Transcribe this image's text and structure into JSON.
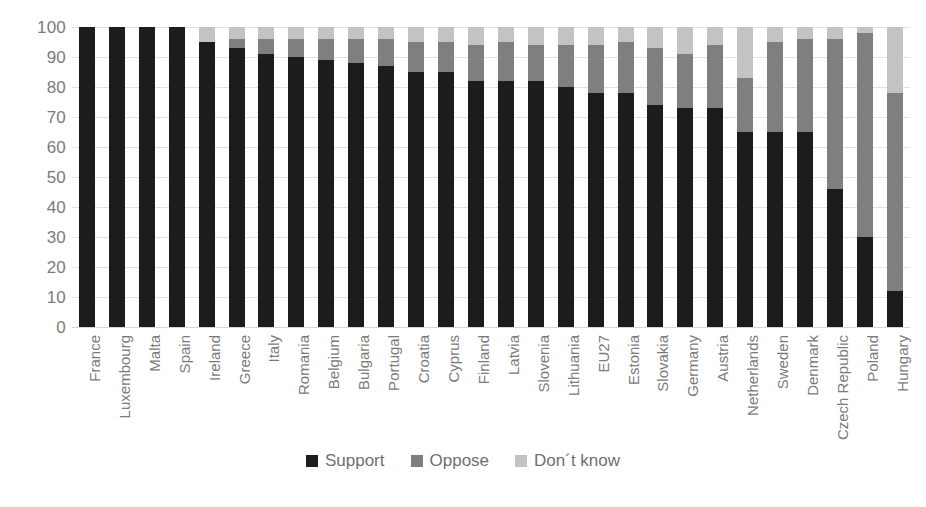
{
  "chart_data": {
    "type": "bar",
    "subtype": "stacked-bar-100",
    "title": "",
    "subtitle": "",
    "xlabel": "",
    "ylabel": "",
    "ylim": [
      0,
      100
    ],
    "yticks": [
      0,
      10,
      20,
      30,
      40,
      50,
      60,
      70,
      80,
      90,
      100
    ],
    "ytick_labels": [
      "0",
      "10",
      "20",
      "30",
      "40",
      "50",
      "60",
      "70",
      "80",
      "90",
      "100"
    ],
    "grid": true,
    "legend_position": "bottom",
    "categories": [
      "France",
      "Luxembourg",
      "Malta",
      "Spain",
      "Ireland",
      "Greece",
      "Italy",
      "Romania",
      "Belgium",
      "Bulgaria",
      "Portugal",
      "Croatia",
      "Cyprus",
      "Finland",
      "Latvia",
      "Slovenia",
      "Lithuania",
      "EU27",
      "Estonia",
      "Slovakia",
      "Germany",
      "Austria",
      "Netherlands",
      "Sweden",
      "Denmark",
      "Czech Republic",
      "Poland",
      "Hungary"
    ],
    "series": [
      {
        "name": "Support",
        "color": "#1c1c1c",
        "values": [
          100,
          100,
          100,
          100,
          95,
          93,
          91,
          90,
          89,
          88,
          87,
          85,
          85,
          82,
          82,
          82,
          80,
          78,
          78,
          74,
          73,
          73,
          65,
          65,
          65,
          46,
          30,
          12
        ]
      },
      {
        "name": "Oppose",
        "color": "#7f7f7f",
        "values": [
          0,
          0,
          0,
          0,
          0,
          3,
          5,
          6,
          7,
          8,
          9,
          10,
          10,
          12,
          13,
          12,
          14,
          16,
          17,
          19,
          18,
          21,
          18,
          30,
          31,
          50,
          68,
          66
        ]
      },
      {
        "name": "Don´t know",
        "color": "#c3c3c3",
        "values": [
          0,
          0,
          0,
          0,
          5,
          4,
          4,
          4,
          4,
          4,
          4,
          5,
          5,
          6,
          5,
          6,
          6,
          6,
          5,
          7,
          9,
          6,
          17,
          5,
          4,
          4,
          2,
          22
        ]
      }
    ],
    "legend": [
      {
        "label": "Support",
        "color": "#1c1c1c",
        "swatch": "legend-swatch-support"
      },
      {
        "label": "Oppose",
        "color": "#7f7f7f",
        "swatch": "legend-swatch-oppose"
      },
      {
        "label": "Don´t know",
        "color": "#c3c3c3",
        "swatch": "legend-swatch-dontknow"
      }
    ]
  },
  "colors": {
    "support": "#1c1c1c",
    "oppose": "#7f7f7f",
    "dontknow": "#c3c3c3",
    "gridline": "#e2e2e2",
    "axis_text": "#7b7b7b",
    "background": "#ffffff"
  }
}
